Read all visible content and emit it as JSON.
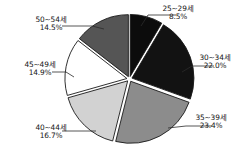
{
  "chart_data": {
    "type": "pie",
    "title": "",
    "subtitle": "",
    "xlabel": "",
    "ylabel": "",
    "legend_position": "none",
    "grid": false,
    "start_angle_deg": 0,
    "direction": "clockwise",
    "exploded": true,
    "categories": [
      "25~29세",
      "30~34세",
      "35~39세",
      "40~44세",
      "45~49세",
      "50~54세"
    ],
    "values": [
      8.5,
      22.0,
      23.4,
      16.7,
      14.9,
      14.5
    ],
    "value_labels": [
      "8.5%",
      "22.0%",
      "23.4%",
      "16.7%",
      "14.9%",
      "14.5%"
    ],
    "colors": [
      "#0c0c0c",
      "#121212",
      "#8c8c8c",
      "#d2d2d2",
      "#ffffff",
      "#555555"
    ],
    "slices": [
      {
        "label": "25~29세",
        "value": 8.5,
        "value_label": "8.5%",
        "color": "#0c0c0c",
        "stroke": "#1a1a1a"
      },
      {
        "label": "30~34세",
        "value": 22.0,
        "value_label": "22.0%",
        "color": "#121212",
        "stroke": "#1a1a1a"
      },
      {
        "label": "35~39세",
        "value": 23.4,
        "value_label": "23.4%",
        "color": "#8c8c8c",
        "stroke": "#1a1a1a"
      },
      {
        "label": "40~44세",
        "value": 16.7,
        "value_label": "16.7%",
        "color": "#d2d2d2",
        "stroke": "#1a1a1a"
      },
      {
        "label": "45~49세",
        "value": 14.9,
        "value_label": "14.9%",
        "color": "#ffffff",
        "stroke": "#1a1a1a"
      },
      {
        "label": "50~54세",
        "value": 14.5,
        "value_label": "14.5%",
        "color": "#555555",
        "stroke": "#1a1a1a"
      }
    ],
    "total": 100.0
  },
  "labels": {
    "s1": {
      "cat": "25~29세",
      "val": "8.5%"
    },
    "s2": {
      "cat": "30~34세",
      "val": "22.0%"
    },
    "s3": {
      "cat": "35~39세",
      "val": "23.4%"
    },
    "s4": {
      "cat": "40~44세",
      "val": "16.7%"
    },
    "s5": {
      "cat": "45~49세",
      "val": "14.9%"
    },
    "s6": {
      "cat": "50~54세",
      "val": "14.5%"
    }
  }
}
